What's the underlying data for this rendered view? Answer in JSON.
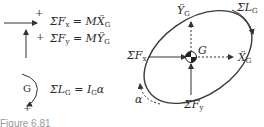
{
  "equations": {
    "fx": {
      "sigma": "ΣF",
      "sub_left": "x",
      "eq": " = ",
      "mass": "M",
      "accel": "Ẍ",
      "sub_right": "G"
    },
    "fy": {
      "sigma": "ΣF",
      "sub_left": "y",
      "eq": " = ",
      "mass": "M",
      "accel": "Ÿ",
      "sub_right": "G"
    },
    "moment": {
      "sigma": "ΣL",
      "sub_left": "G",
      "eq": " = ",
      "inertia": "I",
      "sub_right": "G",
      "alpha": "α"
    }
  },
  "sign_convention": {
    "x_plus": "+",
    "y_plus": "+",
    "rot_plus": "+",
    "rot_center": "G"
  },
  "diagram": {
    "center_label": "G",
    "label_ydd": {
      "main": "Ÿ",
      "sub": "G"
    },
    "label_xdd": {
      "main": "Ẍ",
      "sub": "G"
    },
    "label_sum_fx": {
      "main": "ΣF",
      "sub": "x"
    },
    "label_sum_fy": {
      "main": "ΣF",
      "sub": "y"
    },
    "label_sum_lg": {
      "main": "ΣL",
      "sub": "G"
    },
    "label_alpha": "α",
    "stroke_color": "#3a3a3a"
  },
  "caption": "Figure 6.81"
}
